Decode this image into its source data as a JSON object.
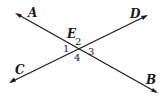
{
  "figure": {
    "lines": [
      {
        "name": "AB",
        "from": "A",
        "to": "B"
      },
      {
        "name": "CD",
        "from": "C",
        "to": "D"
      }
    ],
    "points": {
      "A": "A",
      "B": "B",
      "C": "C",
      "D": "D",
      "E": "E"
    },
    "angles": {
      "a1": "1",
      "a2": "2",
      "a3": "3",
      "a4": "4"
    }
  }
}
